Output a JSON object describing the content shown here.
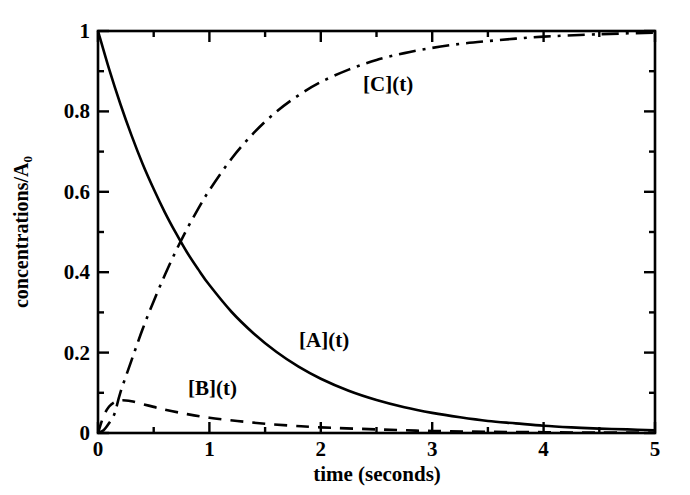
{
  "chart_data": {
    "type": "line",
    "title": "",
    "xlabel": "time (seconds)",
    "ylabel": "concentrations/A",
    "ylabel_sub": "0",
    "xlim": [
      0,
      5
    ],
    "ylim": [
      0,
      1
    ],
    "xticks": [
      "0",
      "1",
      "2",
      "3",
      "4",
      "5"
    ],
    "xtick_values": [
      0,
      1,
      2,
      3,
      4,
      5
    ],
    "xminor_step": 0.5,
    "yticks": [
      "0",
      "0.2",
      "0.4",
      "0.6",
      "0.8",
      "1"
    ],
    "ytick_values": [
      0,
      0.2,
      0.4,
      0.6,
      0.8,
      1
    ],
    "yminor_step": 0.1,
    "grid": false,
    "legend": "inline-annotations",
    "frame": "box-all-sides-inward-ticks",
    "background": "#ffffff",
    "foreground": "#000000",
    "series": [
      {
        "name": "[A](t)",
        "label": "[A](t)",
        "style": "solid",
        "color": "#000000",
        "width": 2.6,
        "label_x": 2.27,
        "label_y": 0.205,
        "x": [
          0,
          0.1,
          0.2,
          0.3,
          0.4,
          0.5,
          0.6,
          0.7,
          0.8,
          0.9,
          1.0,
          1.2,
          1.4,
          1.6,
          1.8,
          2.0,
          2.25,
          2.5,
          2.75,
          3.0,
          3.25,
          3.5,
          3.75,
          4.0,
          4.25,
          4.5,
          4.75,
          5.0
        ],
        "y": [
          1.0,
          0.905,
          0.819,
          0.741,
          0.67,
          0.607,
          0.549,
          0.497,
          0.449,
          0.407,
          0.368,
          0.301,
          0.247,
          0.202,
          0.165,
          0.135,
          0.105,
          0.082,
          0.064,
          0.05,
          0.039,
          0.03,
          0.024,
          0.018,
          0.014,
          0.011,
          0.009,
          0.007
        ]
      },
      {
        "name": "[B](t)",
        "label": "[B](t)",
        "style": "dashed",
        "color": "#000000",
        "width": 2.6,
        "label_x": 1.03,
        "label_y": 0.075,
        "x": [
          0,
          0.05,
          0.1,
          0.15,
          0.2,
          0.25,
          0.3,
          0.4,
          0.5,
          0.6,
          0.8,
          1.0,
          1.25,
          1.5,
          1.75,
          2.0,
          2.5,
          3.0,
          3.5,
          4.0,
          4.5,
          5.0
        ],
        "y": [
          0.0,
          0.042,
          0.066,
          0.077,
          0.081,
          0.081,
          0.079,
          0.072,
          0.065,
          0.058,
          0.047,
          0.038,
          0.03,
          0.023,
          0.018,
          0.014,
          0.009,
          0.005,
          0.003,
          0.002,
          0.001,
          0.001
        ]
      },
      {
        "name": "[C](t)",
        "label": "[C](t)",
        "style": "dashdot",
        "color": "#000000",
        "width": 2.6,
        "label_x": 2.45,
        "label_y": 0.855,
        "x": [
          0,
          0.05,
          0.1,
          0.15,
          0.2,
          0.3,
          0.4,
          0.5,
          0.6,
          0.7,
          0.8,
          0.9,
          1.0,
          1.2,
          1.4,
          1.6,
          1.8,
          2.0,
          2.25,
          2.5,
          2.75,
          3.0,
          3.25,
          3.5,
          3.75,
          4.0,
          4.5,
          5.0
        ],
        "y": [
          0.0,
          0.007,
          0.025,
          0.049,
          0.1,
          0.18,
          0.258,
          0.328,
          0.393,
          0.453,
          0.508,
          0.558,
          0.604,
          0.683,
          0.747,
          0.799,
          0.84,
          0.873,
          0.904,
          0.928,
          0.945,
          0.958,
          0.968,
          0.975,
          0.981,
          0.986,
          0.992,
          0.996
        ]
      }
    ],
    "annotations": [
      {
        "text": "[C](t)",
        "x": 2.45,
        "y": 0.855
      },
      {
        "text": "[A](t)",
        "x": 2.27,
        "y": 0.205
      },
      {
        "text": "[B](t)",
        "x": 1.03,
        "y": 0.075
      }
    ]
  },
  "axes": {
    "x_title": "time (seconds)",
    "y_title_main": "concentrations/A",
    "y_title_sub": "0",
    "xtick_labels": [
      "0",
      "1",
      "2",
      "3",
      "4",
      "5"
    ],
    "ytick_labels": [
      "0",
      "0.2",
      "0.4",
      "0.6",
      "0.8",
      "1"
    ]
  },
  "labels": {
    "a": "[A](t)",
    "b": "[B](t)",
    "c": "[C](t)"
  }
}
